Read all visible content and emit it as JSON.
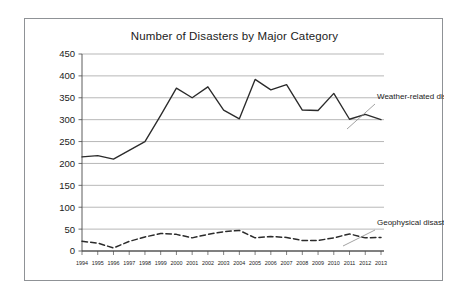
{
  "figure": {
    "title": "Number of Disasters by Major Category",
    "border_color": "#8f9296",
    "background": "#ffffff"
  },
  "annotations": {
    "weather_label": "Weather-related disasters",
    "geophysical_label": "Geophysical disasters"
  },
  "chart_data": {
    "type": "line",
    "title": "Number of Disasters by Major Category",
    "xlabel": "",
    "ylabel": "",
    "categories": [
      "1994",
      "1995",
      "1996",
      "1997",
      "1998",
      "1999",
      "2000",
      "2001",
      "2002",
      "2003",
      "2004",
      "2005",
      "2006",
      "2007",
      "2008",
      "2009",
      "2010",
      "2011",
      "2012",
      "2013"
    ],
    "x_tick_labels": [
      "1994",
      "1995",
      "1996",
      "1997",
      "1998",
      "1999",
      "2000",
      "2001",
      "2002",
      "2003",
      "2004",
      "2005",
      "2006",
      "2007",
      "2008",
      "2009",
      "2010",
      "2011",
      "2012",
      "2013"
    ],
    "y_tick_labels": [
      "0",
      "50",
      "100",
      "150",
      "200",
      "250",
      "300",
      "350",
      "400",
      "450"
    ],
    "y_ticks": [
      0,
      50,
      100,
      150,
      200,
      250,
      300,
      350,
      400,
      450
    ],
    "ylim": [
      0,
      450
    ],
    "grid": "horizontal",
    "legend_position": "inline-annotations",
    "series": [
      {
        "name": "Weather-related disasters",
        "style": "solid",
        "color": "#2b2b2b",
        "values": [
          215,
          218,
          210,
          230,
          250,
          310,
          372,
          350,
          375,
          322,
          302,
          392,
          368,
          380,
          322,
          321,
          360,
          301,
          312,
          300
        ]
      },
      {
        "name": "Geophysical disasters",
        "style": "dashed",
        "color": "#2b2b2b",
        "values": [
          22,
          18,
          7,
          22,
          32,
          40,
          38,
          30,
          38,
          44,
          47,
          30,
          33,
          31,
          24,
          24,
          30,
          39,
          30,
          31
        ]
      }
    ]
  }
}
